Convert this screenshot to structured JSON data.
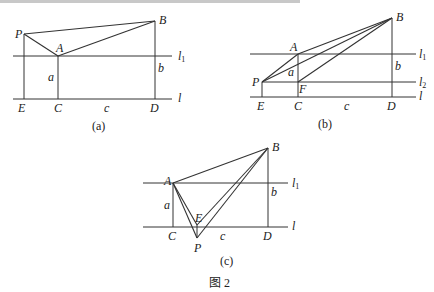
{
  "figure_caption": "图 2",
  "diagrams": {
    "a": {
      "caption": "(a)",
      "labels": {
        "P": "P",
        "A": "A",
        "B": "B",
        "E": "E",
        "C": "C",
        "D": "D",
        "a": "a",
        "b": "b",
        "c": "c",
        "l1_main": "l",
        "l1_sub": "1",
        "l": "l"
      }
    },
    "b": {
      "caption": "(b)",
      "labels": {
        "P": "P",
        "A": "A",
        "B": "B",
        "E": "E",
        "C": "C",
        "D": "D",
        "F": "F",
        "a": "a",
        "b": "b",
        "c": "c",
        "l1_main": "l",
        "l1_sub": "1",
        "l2_main": "l",
        "l2_sub": "2",
        "l": "l"
      }
    },
    "c": {
      "caption": "(c)",
      "labels": {
        "P": "P",
        "A": "A",
        "B": "B",
        "E": "E",
        "C": "C",
        "D": "D",
        "a": "a",
        "b": "b",
        "c": "c",
        "l1_main": "l",
        "l1_sub": "1",
        "l": "l"
      }
    }
  }
}
